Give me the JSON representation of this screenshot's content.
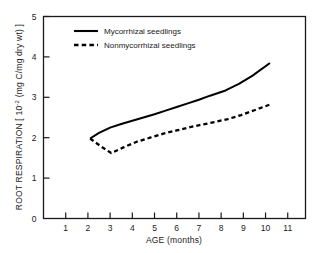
{
  "chart_data": {
    "type": "line",
    "title": "",
    "xlabel": "AGE (months)",
    "ylabel": "ROOT RESPIRATION [ 10",
    "ylabel_sup": "-2",
    "ylabel_tail": " (mg C/mg dry wt) ]",
    "xlim": [
      0,
      11.8
    ],
    "ylim": [
      0,
      5
    ],
    "xticks": [
      1,
      2,
      3,
      4,
      5,
      6,
      7,
      8,
      9,
      10,
      11
    ],
    "yticks": [
      0,
      1,
      2,
      3,
      4,
      5
    ],
    "grid": false,
    "legend_position": "top-left-inside",
    "series": [
      {
        "name": "Mycorrhizal seedlings",
        "style": "solid",
        "color": "#000000",
        "x": [
          2.1,
          2.5,
          3.0,
          3.5,
          4.0,
          4.5,
          5.0,
          5.5,
          6.0,
          6.5,
          7.0,
          7.5,
          8.2,
          8.8,
          9.4,
          10.2
        ],
        "y": [
          1.98,
          2.12,
          2.25,
          2.34,
          2.42,
          2.5,
          2.58,
          2.67,
          2.76,
          2.85,
          2.94,
          3.04,
          3.17,
          3.33,
          3.53,
          3.85
        ]
      },
      {
        "name": "Nonmycorrhizal seedlings",
        "style": "dashed",
        "color": "#000000",
        "x": [
          2.1,
          2.6,
          3.05,
          3.6,
          4.2,
          4.8,
          5.4,
          6.0,
          6.6,
          7.2,
          7.8,
          8.3,
          8.9,
          9.5,
          10.2
        ],
        "y": [
          1.98,
          1.78,
          1.62,
          1.76,
          1.9,
          2.0,
          2.1,
          2.18,
          2.26,
          2.33,
          2.4,
          2.46,
          2.56,
          2.68,
          2.82
        ]
      }
    ]
  },
  "legend": {
    "entries": [
      {
        "label": "Mycorrhizal seedlings",
        "style": "solid"
      },
      {
        "label": "Nonmycorrhizal seedlings",
        "style": "dashed"
      }
    ]
  },
  "axes": {
    "x_tick_labels": [
      "1",
      "2",
      "3",
      "4",
      "5",
      "6",
      "7",
      "8",
      "9",
      "10",
      "11"
    ],
    "y_tick_labels": [
      "0",
      "1",
      "2",
      "3",
      "4",
      "5"
    ],
    "x_axis_title": "AGE (months)",
    "y_axis_title_main": "ROOT RESPIRATION [ 10",
    "y_axis_title_sup": "-2",
    "y_axis_title_end": " (mg C/mg dry wt) ]"
  }
}
